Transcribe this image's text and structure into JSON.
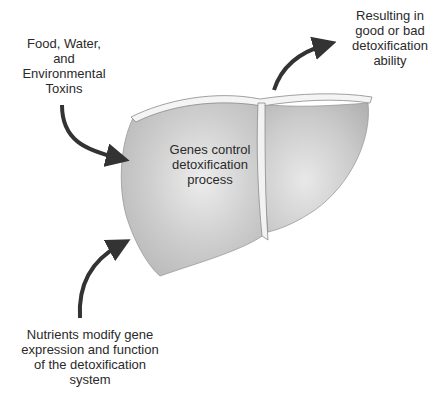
{
  "diagram": {
    "labels": {
      "input": [
        "Food, Water,",
        "and",
        "Environmental",
        "Toxins"
      ],
      "output": [
        "Resulting in",
        "good or bad",
        "detoxification",
        "ability"
      ],
      "nutrients": [
        "Nutrients modify gene",
        "expression and function",
        "of the detoxification",
        "system"
      ],
      "center": [
        "Genes control",
        "detoxification",
        "process"
      ]
    },
    "colors": {
      "liver_fill": "#c4c4c4",
      "arrow": "#333333",
      "outline": "#8a8a8a"
    }
  }
}
